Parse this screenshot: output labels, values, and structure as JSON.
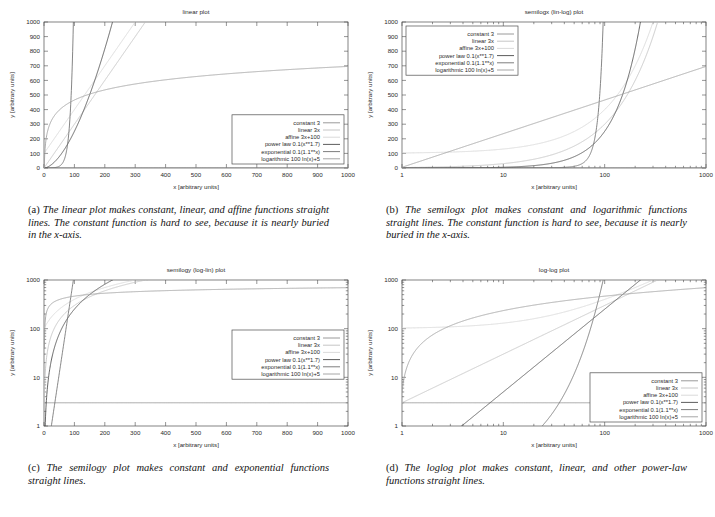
{
  "figure": {
    "panels": [
      {
        "id": "a",
        "title": "linear plot",
        "xlabel": "x [arbitrary units]",
        "ylabel": "y [arbitrary units]",
        "xscale": "linear",
        "yscale": "linear",
        "xlim": [
          0,
          1000
        ],
        "ylim": [
          0,
          1000
        ],
        "xticks": [
          "0",
          "100",
          "200",
          "300",
          "400",
          "500",
          "600",
          "700",
          "800",
          "900",
          "1000"
        ],
        "yticks": [
          "0",
          "100",
          "200",
          "300",
          "400",
          "500",
          "600",
          "700",
          "800",
          "900",
          "1000"
        ],
        "legend_position": "bottom-right",
        "caption_tag": "(a)",
        "caption": "The linear plot makes constant, linear, and affine functions straight lines. The constant function is hard to see, because it is nearly buried in the x-axis."
      },
      {
        "id": "b",
        "title": "semilogx (lin-log) plot",
        "xlabel": "x [arbitrary units]",
        "ylabel": "y [arbitrary units]",
        "xscale": "log",
        "yscale": "linear",
        "xlim": [
          1,
          1000
        ],
        "ylim": [
          0,
          1000
        ],
        "xticks": [
          "1",
          "10",
          "100",
          "1000"
        ],
        "yticks": [
          "0",
          "100",
          "200",
          "300",
          "400",
          "500",
          "600",
          "700",
          "800",
          "900",
          "1000"
        ],
        "legend_position": "top-left",
        "caption_tag": "(b)",
        "caption": "The semilogx plot makes constant and logarithmic functions straight lines. The constant function is hard to see, because it is nearly buried in the x-axis."
      },
      {
        "id": "c",
        "title": "semilogy (log-lin) plot",
        "xlabel": "x [arbitrary units]",
        "ylabel": "y [arbitrary units]",
        "xscale": "linear",
        "yscale": "log",
        "xlim": [
          0,
          1000
        ],
        "ylim": [
          1,
          1000
        ],
        "xticks": [
          "0",
          "100",
          "200",
          "300",
          "400",
          "500",
          "600",
          "700",
          "800",
          "900",
          "1000"
        ],
        "yticks": [
          "1",
          "10",
          "100",
          "1000"
        ],
        "legend_position": "middle-right",
        "caption_tag": "(c)",
        "caption": "The semilogy plot makes constant and exponential functions straight lines."
      },
      {
        "id": "d",
        "title": "log-log plot",
        "xlabel": "x [arbitrary units]",
        "ylabel": "y [arbitrary units]",
        "xscale": "log",
        "yscale": "log",
        "xlim": [
          1,
          1000
        ],
        "ylim": [
          1,
          1000
        ],
        "xticks": [
          "1",
          "10",
          "100",
          "1000"
        ],
        "yticks": [
          "1",
          "10",
          "100",
          "1000"
        ],
        "legend_position": "bottom-right",
        "caption_tag": "(d)",
        "caption": "The loglog plot makes constant, linear, and other power-law functions straight lines."
      }
    ]
  },
  "chart_data": {
    "type": "line",
    "xlabel": "x [arbitrary units]",
    "ylabel": "y [arbitrary units]",
    "grid": false,
    "legend_position": "inset",
    "x_domain": [
      1,
      1000
    ],
    "y_domain": [
      1,
      1000
    ],
    "series": [
      {
        "name": "constant 3",
        "fn": "const",
        "a": 3,
        "color": "#8f8f8f"
      },
      {
        "name": "linear 3x",
        "fn": "linear",
        "a": 3,
        "color": "#c0c0c0"
      },
      {
        "name": "affine 3x+100",
        "fn": "affine",
        "a": 3,
        "b": 100,
        "color": "#d6d6d6"
      },
      {
        "name": "power law 0.1(x**1.7)",
        "fn": "power",
        "a": 0.1,
        "p": 1.7,
        "color": "#4a4a4a"
      },
      {
        "name": "exponential 0.1(1.1**x)",
        "fn": "exp",
        "a": 0.1,
        "base": 1.1,
        "color": "#6f6f6f"
      },
      {
        "name": "logarithmic 100 ln(x)+5",
        "fn": "log",
        "a": 100,
        "b": 5,
        "color": "#9c9c9c"
      }
    ]
  }
}
